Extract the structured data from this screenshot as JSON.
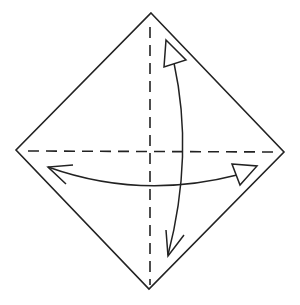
{
  "diagram": {
    "type": "origami-fold-diagram",
    "colors": {
      "background": "#ffffff",
      "stroke": "#222222"
    },
    "paper": {
      "shape": "diamond",
      "points": [
        [
          151,
          13
        ],
        [
          284,
          152
        ],
        [
          149,
          289
        ],
        [
          16,
          150
        ]
      ]
    },
    "creases": [
      {
        "name": "vertical-valley-fold",
        "style": "dashed",
        "x1": 150,
        "y1": 27,
        "x2": 150,
        "y2": 285
      },
      {
        "name": "horizontal-valley-fold",
        "style": "dashed",
        "x1": 28,
        "y1": 151,
        "x2": 276,
        "y2": 152
      }
    ],
    "arrows": [
      {
        "name": "vertical-fold-unfold-arrow",
        "kind": "fold-and-unfold"
      },
      {
        "name": "horizontal-fold-unfold-arrow",
        "kind": "fold-and-unfold"
      }
    ]
  }
}
